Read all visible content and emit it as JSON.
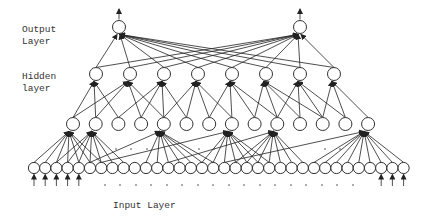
{
  "diagram": {
    "type": "neural-network",
    "labels": {
      "output_line1": "Output",
      "output_line2": "Layer",
      "hidden_line1": "Hidden",
      "hidden_line2": "layer",
      "input": "Input Layer"
    },
    "colors": {
      "stroke": "#333333",
      "background": "#ffffff",
      "text": "#333333"
    },
    "layers": {
      "output": {
        "count": 2,
        "x": [
          119,
          300
        ],
        "y": 27,
        "r": 6.5
      },
      "upper_hidden": {
        "count": 8,
        "x_start": 96,
        "spacing": 34,
        "y": 74,
        "r": 6.5
      },
      "lower_hidden": {
        "count": 14,
        "x_start": 73,
        "spacing": 22.7,
        "y": 124,
        "r": 6.5
      },
      "input": {
        "count": 34,
        "x_start": 34,
        "spacing": 11.2,
        "y": 168,
        "r": 5.6
      }
    },
    "input_arrows": {
      "left_indices": [
        0,
        1,
        2,
        3,
        4
      ],
      "right_indices": [
        31,
        32,
        33
      ]
    },
    "upper_to_lower_fanin": [
      [
        0,
        1,
        2
      ],
      [
        0,
        1,
        3,
        4
      ],
      [
        2,
        3,
        4,
        5
      ],
      [
        4,
        5,
        6,
        7
      ],
      [
        6,
        7,
        8,
        9
      ],
      [
        8,
        9,
        10,
        11
      ],
      [
        9,
        10,
        11,
        12
      ],
      [
        11,
        12,
        13
      ]
    ],
    "lower_to_input_fanin": {
      "0": [
        0,
        1,
        2,
        3,
        4,
        5,
        6
      ],
      "1": [
        2,
        3,
        4,
        5,
        6,
        7,
        8
      ],
      "4": [
        10,
        11,
        12,
        13,
        14,
        15,
        16,
        5
      ],
      "7": [
        15,
        16,
        17,
        18,
        19,
        20,
        21,
        6
      ],
      "9": [
        18,
        19,
        20,
        21,
        22,
        23,
        24,
        12
      ],
      "13": [
        25,
        26,
        27,
        28,
        29,
        30,
        31,
        32,
        33,
        17
      ]
    },
    "ellipsis_dots": {
      "below_inputs": {
        "y": 185,
        "x": [
          105,
          120,
          136,
          151,
          167,
          182,
          198,
          213,
          229,
          244,
          260,
          275,
          291,
          306,
          322,
          337,
          353
        ]
      },
      "between_layers": {
        "y": 149,
        "x": [
          116,
          131,
          147,
          199,
          214,
          325,
          340
        ]
      }
    }
  }
}
